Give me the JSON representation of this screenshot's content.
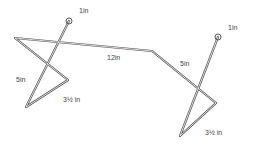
{
  "diagram": {
    "title": "",
    "labels": {
      "left_loop": "1in",
      "right_loop": "1in",
      "crossbar": "12in",
      "left_leg": "5in",
      "left_base": "3½ in",
      "right_leg": "5in",
      "right_base": "3½ in"
    },
    "stroke_color": "#555555"
  }
}
